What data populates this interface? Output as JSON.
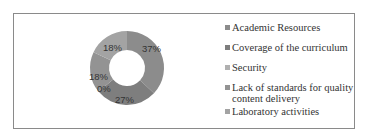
{
  "chart_data": {
    "type": "pie",
    "subtype": "donut",
    "title": "",
    "categories": [
      "Academic Resources",
      "Coverage of the curriculum",
      "Security",
      "Lack of standards for quality content delivery",
      "Laboratory activities"
    ],
    "values": [
      37,
      27,
      0,
      18,
      18
    ],
    "unit": "%",
    "data_labels": [
      "37%",
      "27%",
      "0%",
      "18%",
      "18%"
    ],
    "colors": [
      "#8c8c8c",
      "#7e7e7e",
      "#b0b0b0",
      "#939393",
      "#a3a3a3"
    ],
    "legend_position": "right"
  },
  "legend": {
    "items": [
      {
        "label": "Academic Resources",
        "color": "#8c8c8c",
        "top": 0
      },
      {
        "label": "Coverage of the curriculum",
        "color": "#7e7e7e",
        "top": 20
      },
      {
        "label": "Security",
        "color": "#b0b0b0",
        "top": 40
      },
      {
        "label": "Lack of standards for quality content delivery",
        "color": "#939393",
        "top": 60
      },
      {
        "label": "Laboratory activities",
        "color": "#a3a3a3",
        "top": 84
      }
    ]
  },
  "labels": {
    "academic": "37%",
    "coverage": "27%",
    "security": "0%",
    "lack": "18%",
    "lab": "18%"
  }
}
